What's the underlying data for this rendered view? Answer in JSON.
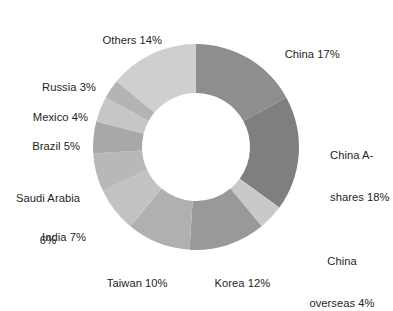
{
  "chart_data": {
    "type": "pie",
    "variant": "donut",
    "title": "",
    "subtitle": "",
    "xlabel": "",
    "ylabel": "",
    "grid": false,
    "legend_position": "labels-outside",
    "units": "percent",
    "total": 100,
    "start_angle_deg": 0,
    "direction": "clockwise",
    "categories": [
      "China",
      "China A-shares",
      "China overseas",
      "Korea",
      "Taiwan",
      "India",
      "Saudi Arabia",
      "Brazil",
      "Mexico",
      "Russia",
      "Others"
    ],
    "values": [
      17,
      18,
      4,
      12,
      10,
      7,
      6,
      5,
      4,
      3,
      14
    ],
    "colors": [
      "#8e8e8e",
      "#7f7f7f",
      "#c9c9c9",
      "#999999",
      "#b0b0b0",
      "#c2c2c2",
      "#b8b8b8",
      "#a8a8a8",
      "#c6c6c6",
      "#b4b4b4",
      "#cfcfcf"
    ],
    "slices": [
      {
        "label": "China 17%",
        "name": "China",
        "value": 17,
        "color": "#8e8e8e"
      },
      {
        "label": "China A-shares 18%",
        "name": "China A-shares",
        "value": 18,
        "color": "#7f7f7f"
      },
      {
        "label": "China overseas 4%",
        "name": "China overseas",
        "value": 4,
        "color": "#c9c9c9"
      },
      {
        "label": "Korea 12%",
        "name": "Korea",
        "value": 12,
        "color": "#999999"
      },
      {
        "label": "Taiwan 10%",
        "name": "Taiwan",
        "value": 10,
        "color": "#b0b0b0"
      },
      {
        "label": "India 7%",
        "name": "India",
        "value": 7,
        "color": "#c2c2c2"
      },
      {
        "label": "Saudi Arabia 6%",
        "name": "Saudi Arabia",
        "value": 6,
        "color": "#b8b8b8"
      },
      {
        "label": "Brazil 5%",
        "name": "Brazil",
        "value": 5,
        "color": "#a8a8a8"
      },
      {
        "label": "Mexico 4%",
        "name": "Mexico",
        "value": 4,
        "color": "#c6c6c6"
      },
      {
        "label": "Russia 3%",
        "name": "Russia",
        "value": 3,
        "color": "#b4b4b4"
      },
      {
        "label": "Others 14%",
        "name": "Others",
        "value": 14,
        "color": "#cfcfcf"
      }
    ]
  },
  "labels": {
    "china": "China 17%",
    "china_a_shares_line1": "China A-",
    "china_a_shares_line2": "shares 18%",
    "china_overseas_line1": "China",
    "china_overseas_line2": "overseas 4%",
    "korea": "Korea 12%",
    "taiwan": "Taiwan 10%",
    "india": "India 7%",
    "saudi_arabia_line1": "Saudi Arabia",
    "saudi_arabia_line2": "6%",
    "brazil": "Brazil 5%",
    "mexico": "Mexico 4%",
    "russia": "Russia 3%",
    "others": "Others 14%"
  },
  "geometry": {
    "center_x": 196,
    "center_y": 147,
    "outer_radius": 103,
    "inner_radius": 54
  },
  "style": {
    "background": "#ffffff",
    "text_color": "#231f20"
  }
}
